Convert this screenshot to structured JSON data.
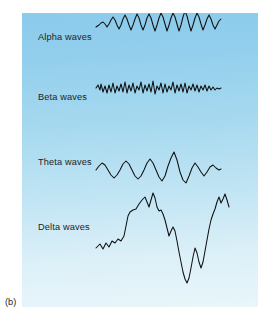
{
  "figure": {
    "caption": "(b)",
    "panel": {
      "background_top_color": "#8ccbec",
      "background_bottom_color": "#e9f6fa",
      "trace_color": "#101010"
    },
    "waves": [
      {
        "id": "alpha",
        "label": "Alpha waves",
        "description": "regular rhythmic sinusoidal oscillation, moderate amplitude, about 13 cycles",
        "baseline_y": 40,
        "amplitude": 9,
        "cycles": 13,
        "points": "96,27 99,25 101,23 103,22 105,24 107,27 109,24 111,20 113,17 115,20 117,25 119,29 121,25 123,19 125,15 127,19 129,25 131,30 133,25 135,19 137,14 139,18 141,25 143,30 145,25 147,18 149,14 151,18 153,25 155,31 157,25 159,18 161,13 163,17 165,24 167,31 169,25 171,18 173,13 175,17 177,24 179,31 181,25 183,17 185,11 187,16 189,24 191,31 193,25 195,18 197,13 199,17 201,24 203,30 205,25 207,19 209,15 211,19 213,25 215,29 217,25 219,21 221,19"
      },
      {
        "id": "beta",
        "label": "Beta waves",
        "description": "fast low-amplitude irregular activity, highest frequency of the four",
        "baseline_y": 100,
        "amplitude": 5,
        "cycles": 30,
        "points": "96,88 98,85 100,90 101,84 103,92 105,86 107,93 109,85 111,92 113,83 115,93 117,86 119,91 121,84 123,92 125,82 127,93 129,85 131,91 133,83 135,93 137,86 139,90 141,82 143,93 145,85 147,91 149,84 151,92 153,81 155,94 157,86 159,90 161,83 163,93 165,84 167,92 169,86 171,90 173,82 175,93 177,85 179,91 181,84 183,92 185,83 187,93 189,86 191,90 193,84 195,91 197,85 199,92 201,86 203,90 205,85 207,91 209,86 211,90 213,87 215,90 217,88 219,89 221,88"
      },
      {
        "id": "theta",
        "label": "Theta waves",
        "description": "slower rounded waves with larger amplitude and one prominent tall spike",
        "baseline_y": 170,
        "amplitude": 12,
        "cycles": 7,
        "points": "96,170 99,166 102,163 105,165 108,170 111,175 114,178 117,175 120,170 123,164 126,161 129,164 132,170 135,176 138,179 141,176 144,170 147,163 150,159 153,163 156,170 159,177 162,181 165,176 168,166 171,158 174,152 177,160 180,172 183,180 186,183 189,176 192,168 195,163 198,167 201,172 204,176 207,172 210,167 213,165 216,168 219,170 221,169"
      },
      {
        "id": "delta",
        "label": "Delta waves",
        "description": "very slow, very large amplitude swings with a broad plateau and a deep trough",
        "baseline_y": 245,
        "amplitude": 34,
        "cycles": 3,
        "points": "96,248 100,244 103,249 106,243 109,247 112,241 115,243 118,239 121,241 124,236 126,226 128,216 130,212 133,210 136,209 139,204 142,200 145,197 147,202 149,207 151,200 153,193 155,198 157,207 159,211 161,210 163,214 165,220 167,228 169,236 171,231 173,227 175,231 177,241 179,252 181,262 183,272 185,279 187,283 189,278 191,268 193,257 195,248 197,253 199,262 201,268 203,262 205,251 207,240 209,229 211,220 213,214 215,209 217,202 219,197 221,203 223,199 225,194 227,200 229,207"
      }
    ]
  }
}
